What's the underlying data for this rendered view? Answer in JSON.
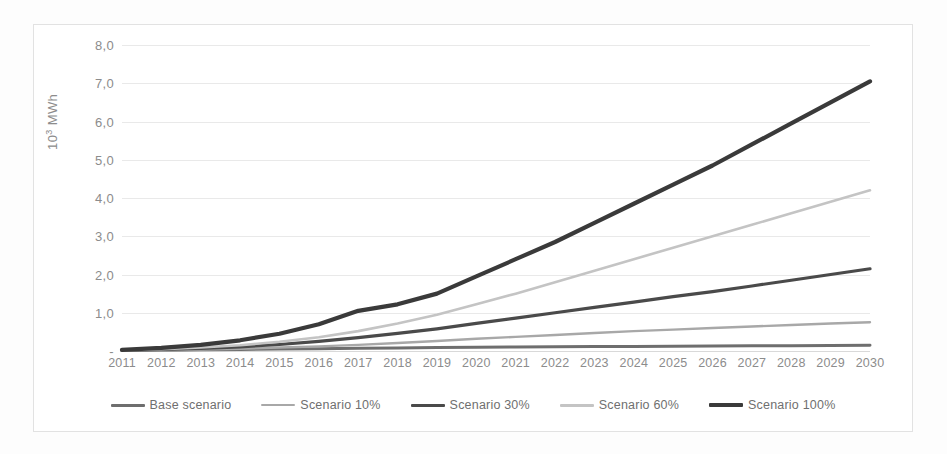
{
  "chart_data": {
    "type": "line",
    "title": "",
    "xlabel": "",
    "ylabel": "10³ MWh",
    "ylabel_base": "10",
    "ylabel_sup": "3",
    "ylabel_unit": " MWh",
    "grid": true,
    "legend_position": "bottom",
    "ylim": [
      0,
      8
    ],
    "ytick_labels": [
      "8,0",
      "7,0",
      "6,0",
      "5,0",
      "4,0",
      "3,0",
      "2,0",
      "1,0",
      "-"
    ],
    "ytick_values": [
      8,
      7,
      6,
      5,
      4,
      3,
      2,
      1,
      0
    ],
    "categories": [
      "2011",
      "2012",
      "2013",
      "2014",
      "2015",
      "2016",
      "2017",
      "2018",
      "2019",
      "2020",
      "2021",
      "2022",
      "2023",
      "2024",
      "2025",
      "2026",
      "2027",
      "2028",
      "2029",
      "2030"
    ],
    "series": [
      {
        "name": "Base scenario",
        "color": "#6e6e6e",
        "width": 3.0,
        "values": [
          0.01,
          0.02,
          0.03,
          0.04,
          0.05,
          0.06,
          0.07,
          0.08,
          0.09,
          0.1,
          0.105,
          0.11,
          0.115,
          0.12,
          0.125,
          0.13,
          0.135,
          0.14,
          0.145,
          0.15
        ]
      },
      {
        "name": "Scenario 10%",
        "color": "#a8a8a8",
        "width": 2.4,
        "values": [
          0.01,
          0.02,
          0.04,
          0.06,
          0.09,
          0.12,
          0.16,
          0.21,
          0.26,
          0.32,
          0.37,
          0.42,
          0.47,
          0.52,
          0.56,
          0.6,
          0.64,
          0.68,
          0.72,
          0.75
        ]
      },
      {
        "name": "Scenario 30%",
        "color": "#4a4a4a",
        "width": 3.2,
        "values": [
          0.02,
          0.04,
          0.07,
          0.11,
          0.17,
          0.25,
          0.35,
          0.46,
          0.58,
          0.72,
          0.86,
          1.0,
          1.14,
          1.28,
          1.42,
          1.55,
          1.7,
          1.85,
          2.0,
          2.15
        ]
      },
      {
        "name": "Scenario 60%",
        "color": "#c4c4c4",
        "width": 2.6,
        "values": [
          0.02,
          0.05,
          0.09,
          0.15,
          0.24,
          0.36,
          0.52,
          0.72,
          0.95,
          1.22,
          1.5,
          1.8,
          2.1,
          2.4,
          2.7,
          3.0,
          3.3,
          3.6,
          3.9,
          4.2
        ]
      },
      {
        "name": "Scenario 100%",
        "color": "#3a3a3a",
        "width": 4.2,
        "values": [
          0.03,
          0.08,
          0.16,
          0.28,
          0.45,
          0.7,
          1.05,
          1.22,
          1.5,
          1.95,
          2.4,
          2.85,
          3.35,
          3.85,
          4.35,
          4.85,
          5.4,
          5.95,
          6.5,
          7.05
        ]
      }
    ]
  },
  "legend": {
    "items": [
      {
        "label": "Base scenario"
      },
      {
        "label": "Scenario 10%"
      },
      {
        "label": "Scenario 30%"
      },
      {
        "label": "Scenario 60%"
      },
      {
        "label": "Scenario 100%"
      }
    ]
  }
}
